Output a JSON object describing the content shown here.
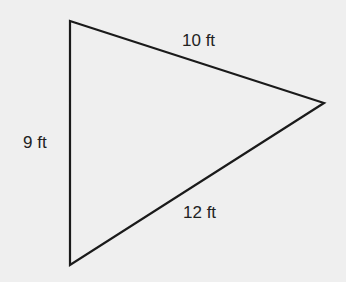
{
  "diagram": {
    "type": "triangle",
    "background": "#efefef",
    "stroke_color": "#1a1a1a",
    "vertices": [
      [
        70,
        21
      ],
      [
        324,
        103
      ],
      [
        70,
        265
      ]
    ],
    "sides": [
      {
        "name": "top",
        "label": "10 ft"
      },
      {
        "name": "left",
        "label": "9 ft"
      },
      {
        "name": "bottom",
        "label": "12 ft"
      }
    ]
  }
}
